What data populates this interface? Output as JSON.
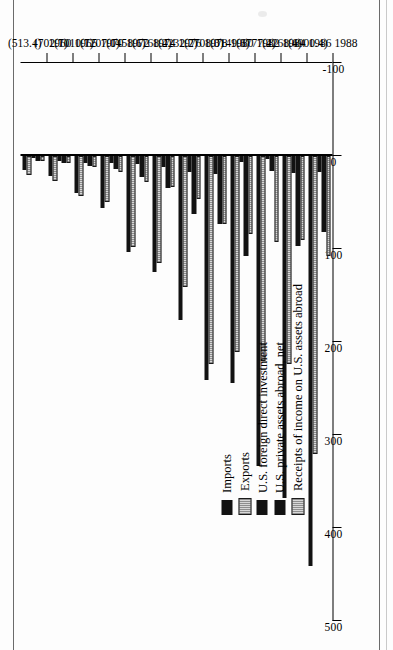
{
  "figure": {
    "orientation": "rotated-90-ccw",
    "background": "#ffffff",
    "ink": "#121212",
    "hatch": "#b5b5b5"
  },
  "legend": {
    "position": "inside-upper-left",
    "items": [
      {
        "key": "imports",
        "label": "Imports",
        "color": "#121212",
        "pattern": "solid"
      },
      {
        "key": "exports",
        "label": "Exports",
        "color": "#b5b5b5",
        "pattern": "stipple"
      },
      {
        "key": "fdi",
        "label": "U.S. foreign direct investment",
        "color": "#121212",
        "pattern": "solid"
      },
      {
        "key": "assets",
        "label": "U.S. private assets abroad, net",
        "color": "#121212",
        "pattern": "solid"
      },
      {
        "key": "receipts",
        "label": "Receipts of income on U.S. assets abroad",
        "color": "#b5b5b5",
        "pattern": "stipple"
      }
    ]
  },
  "value_axis": {
    "ticks": [
      500,
      400,
      300,
      200,
      100,
      0,
      -100
    ],
    "tick_labels": [
      "500",
      "400",
      "300",
      "200",
      "100",
      "0",
      "-100"
    ],
    "min": -100,
    "max": 500
  },
  "category_axis": {
    "years": [
      "1960",
      "1965",
      "1970",
      "1972",
      "1974",
      "1976",
      "1978",
      "1980",
      "1982",
      "1984",
      "1986",
      "1988"
    ],
    "totals": [
      "(513.4)",
      "(702.7)",
      "(1010.7)",
      "(1207.0)",
      "(1458.6)",
      "(1768.4)",
      "(2232.7)",
      "(2708.0)",
      "(3149.6)",
      "(3777.2)",
      "(4268.6)",
      "(4900.4)"
    ]
  },
  "chart_data": {
    "type": "bar",
    "title": "",
    "subtitle": "",
    "xlabel": "",
    "ylabel": "",
    "orientation": "horizontal",
    "grid": false,
    "legend_position": "inside-upper-left",
    "ylim": [
      -100,
      500
    ],
    "categories": [
      "1960",
      "1965",
      "1970",
      "1972",
      "1974",
      "1976",
      "1978",
      "1980",
      "1982",
      "1984",
      "1986",
      "1988"
    ],
    "category_totals": [
      513.4,
      702.7,
      1010.7,
      1207.0,
      1458.6,
      1768.4,
      2232.7,
      2708.0,
      3149.6,
      3777.2,
      4268.6,
      4900.4
    ],
    "series": [
      {
        "name": "Imports",
        "values": [
          15,
          22,
          40,
          56,
          103,
          125,
          176,
          241,
          244,
          333,
          368,
          441
        ]
      },
      {
        "name": "Exports",
        "values": [
          20,
          27,
          43,
          49,
          98,
          115,
          141,
          224,
          211,
          220,
          224,
          320
        ]
      },
      {
        "name": "U.S. foreign direct investment",
        "values": [
          2,
          5,
          7,
          8,
          9,
          12,
          17,
          19,
          6,
          3,
          18,
          17
        ]
      },
      {
        "name": "U.S. private assets abroad, net",
        "values": [
          5,
          8,
          11,
          14,
          23,
          34,
          62,
          73,
          108,
          16,
          97,
          82
        ]
      },
      {
        "name": "Receipts of income on U.S. assets abroad",
        "values": [
          5,
          8,
          12,
          17,
          28,
          33,
          46,
          73,
          84,
          92,
          90,
          107
        ]
      }
    ]
  }
}
